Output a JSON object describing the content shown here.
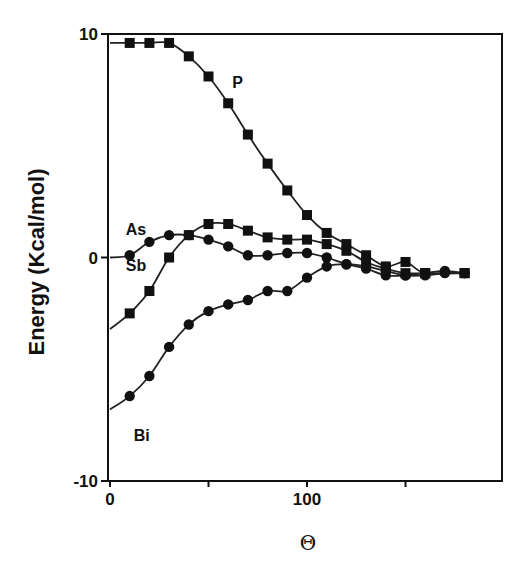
{
  "chart_data": {
    "type": "line",
    "title": "",
    "xlabel": "Θ",
    "ylabel": "Energy (Kcal/mol)",
    "xlim": [
      0,
      185
    ],
    "ylim": [
      -10,
      10
    ],
    "x_ticks": [
      0,
      50,
      100,
      150
    ],
    "x_tick_labels": [
      "0",
      "",
      "100",
      ""
    ],
    "y_ticks": [
      10,
      0,
      -10
    ],
    "y_tick_labels": [
      "10",
      "0",
      "-10"
    ],
    "grid": false,
    "legend": "inline labels",
    "series": [
      {
        "name": "P",
        "marker": "square",
        "x": [
          0,
          10,
          20,
          30,
          40,
          50,
          60,
          70,
          80,
          90,
          100,
          110,
          120,
          130,
          140,
          150,
          160,
          180
        ],
        "y": [
          9.6,
          9.6,
          9.6,
          9.6,
          9.0,
          8.1,
          6.9,
          5.5,
          4.2,
          3.0,
          1.9,
          1.1,
          0.6,
          0.1,
          -0.4,
          -0.2,
          -0.7,
          -0.7
        ]
      },
      {
        "name": "As",
        "marker": "circle",
        "x": [
          0,
          10,
          20,
          30,
          40,
          50,
          60,
          70,
          80,
          90,
          100,
          110,
          120,
          130,
          140,
          150,
          160,
          170,
          180
        ],
        "y": [
          0.0,
          0.1,
          0.7,
          1.0,
          1.0,
          0.8,
          0.5,
          0.1,
          0.1,
          0.2,
          0.2,
          0.0,
          -0.3,
          -0.5,
          -0.8,
          -0.8,
          -0.7,
          -0.6,
          -0.7
        ]
      },
      {
        "name": "Sb",
        "marker": "square",
        "x": [
          0,
          10,
          20,
          30,
          40,
          50,
          60,
          70,
          80,
          90,
          100,
          110,
          120,
          130,
          140,
          150,
          160,
          180
        ],
        "y": [
          -3.2,
          -2.5,
          -1.5,
          0.0,
          1.0,
          1.5,
          1.5,
          1.2,
          0.9,
          0.8,
          0.8,
          0.6,
          0.3,
          -0.2,
          -0.5,
          -0.7,
          -0.7,
          -0.7
        ]
      },
      {
        "name": "Bi",
        "marker": "circle",
        "x": [
          0,
          10,
          20,
          30,
          40,
          50,
          60,
          70,
          80,
          90,
          100,
          110,
          120,
          130,
          140,
          150,
          160,
          170,
          180
        ],
        "y": [
          -6.8,
          -6.2,
          -5.3,
          -4.0,
          -3.0,
          -2.4,
          -2.1,
          -1.9,
          -1.5,
          -1.5,
          -0.9,
          -0.4,
          -0.3,
          -0.4,
          -0.6,
          -0.8,
          -0.8,
          -0.7,
          -0.7
        ]
      }
    ],
    "annotations": [
      {
        "text": "P",
        "x": 62,
        "y": 7.6
      },
      {
        "text": "As",
        "x": 8,
        "y": 1.0
      },
      {
        "text": "Sb",
        "x": 8,
        "y": -0.6
      },
      {
        "text": "Bi",
        "x": 12,
        "y": -8.2
      }
    ]
  }
}
